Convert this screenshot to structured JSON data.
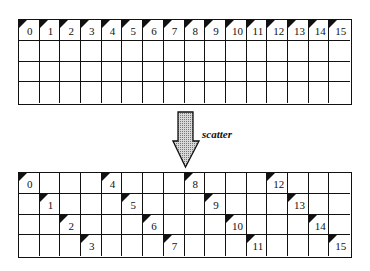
{
  "diagram": {
    "operation_label": "scatter",
    "grid_cols": 16,
    "grid_rows": 4,
    "before": {
      "title": "",
      "elements": [
        {
          "value": "0",
          "row": 0,
          "col": 0
        },
        {
          "value": "1",
          "row": 0,
          "col": 1
        },
        {
          "value": "2",
          "row": 0,
          "col": 2
        },
        {
          "value": "3",
          "row": 0,
          "col": 3
        },
        {
          "value": "4",
          "row": 0,
          "col": 4
        },
        {
          "value": "5",
          "row": 0,
          "col": 5
        },
        {
          "value": "6",
          "row": 0,
          "col": 6
        },
        {
          "value": "7",
          "row": 0,
          "col": 7
        },
        {
          "value": "8",
          "row": 0,
          "col": 8
        },
        {
          "value": "9",
          "row": 0,
          "col": 9
        },
        {
          "value": "10",
          "row": 0,
          "col": 10
        },
        {
          "value": "11",
          "row": 0,
          "col": 11
        },
        {
          "value": "12",
          "row": 0,
          "col": 12
        },
        {
          "value": "13",
          "row": 0,
          "col": 13
        },
        {
          "value": "14",
          "row": 0,
          "col": 14
        },
        {
          "value": "15",
          "row": 0,
          "col": 15
        }
      ]
    },
    "after": {
      "elements": [
        {
          "value": "0",
          "row": 0,
          "col": 0
        },
        {
          "value": "1",
          "row": 1,
          "col": 1
        },
        {
          "value": "2",
          "row": 2,
          "col": 2
        },
        {
          "value": "3",
          "row": 3,
          "col": 3
        },
        {
          "value": "4",
          "row": 0,
          "col": 4
        },
        {
          "value": "5",
          "row": 1,
          "col": 5
        },
        {
          "value": "6",
          "row": 2,
          "col": 6
        },
        {
          "value": "7",
          "row": 3,
          "col": 7
        },
        {
          "value": "8",
          "row": 0,
          "col": 8
        },
        {
          "value": "9",
          "row": 1,
          "col": 9
        },
        {
          "value": "10",
          "row": 2,
          "col": 10
        },
        {
          "value": "11",
          "row": 3,
          "col": 11
        },
        {
          "value": "12",
          "row": 0,
          "col": 12
        },
        {
          "value": "13",
          "row": 1,
          "col": 13
        },
        {
          "value": "14",
          "row": 2,
          "col": 14
        },
        {
          "value": "15",
          "row": 3,
          "col": 15
        }
      ]
    },
    "colors": {
      "line": "#111111",
      "arrow_fill": "#b0b0b0",
      "background": "#ffffff"
    }
  }
}
